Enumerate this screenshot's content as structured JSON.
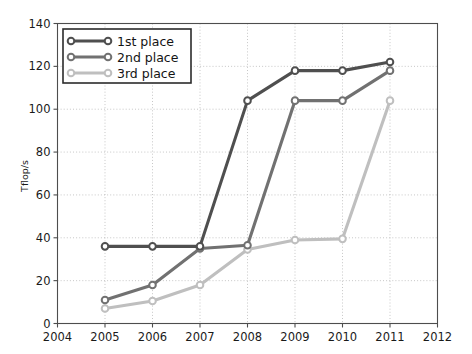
{
  "chart_data": {
    "type": "line",
    "title": "",
    "xlabel": "",
    "ylabel": "Tflop/s",
    "x": [
      2005,
      2006,
      2007,
      2008,
      2009,
      2010,
      2011
    ],
    "xlim": [
      2004,
      2012
    ],
    "ylim": [
      0,
      140
    ],
    "xticks": [
      2004,
      2005,
      2006,
      2007,
      2008,
      2009,
      2010,
      2011,
      2012
    ],
    "xtick_labels": [
      "2004",
      "2005",
      "2006",
      "2007",
      "2008",
      "2009",
      "2010",
      "2011",
      "2012"
    ],
    "yticks": [
      0,
      20,
      40,
      60,
      80,
      100,
      120,
      140
    ],
    "ytick_labels": [
      "0",
      "20",
      "40",
      "60",
      "80",
      "100",
      "120",
      "140"
    ],
    "grid": true,
    "legend_position": "upper left",
    "marker": "circle-open",
    "series": [
      {
        "name": "1st place",
        "color": "#4f4f4f",
        "values": [
          36,
          36,
          36,
          104,
          118,
          118,
          122
        ]
      },
      {
        "name": "2nd place",
        "color": "#717171",
        "values": [
          11,
          18,
          35,
          36.5,
          104,
          104,
          118
        ]
      },
      {
        "name": "3rd place",
        "color": "#bfbfbf",
        "values": [
          7,
          10.5,
          18,
          34.5,
          39,
          39.5,
          104
        ]
      }
    ]
  },
  "legend": {
    "entries": [
      {
        "label": "1st place"
      },
      {
        "label": "2nd place"
      },
      {
        "label": "3rd place"
      }
    ]
  },
  "axes": {
    "y_axis_title": "Tflop/s"
  }
}
